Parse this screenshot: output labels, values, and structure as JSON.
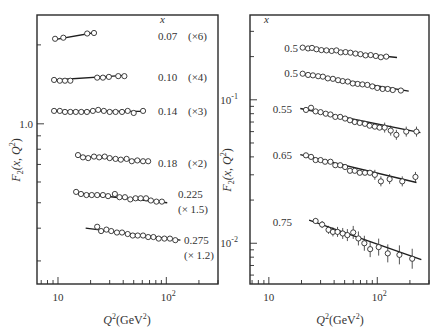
{
  "chart_data": [
    {
      "type": "scatter",
      "panel": "left",
      "title": "",
      "xlabel": "Q²(GeV²)",
      "ylabel": "F₂(x, Q²)",
      "xscale": "log",
      "yscale": "log",
      "xlim": [
        6.4,
        300
      ],
      "ylim": [
        0.245,
        2.6
      ],
      "x_ticks": [
        {
          "value": 10,
          "label": "10"
        },
        {
          "value": 100,
          "label": "10",
          "sup": "2"
        }
      ],
      "y_ticks": [
        {
          "value": 1.0,
          "label": "1.0"
        }
      ],
      "y_minor_ticks": [
        0.3,
        0.4,
        0.5,
        0.6,
        0.7,
        0.8,
        0.9,
        2.0
      ],
      "legend_header": "x",
      "series": [
        {
          "name": "0.07",
          "scale": "(×6)",
          "fit": [
            [
              9.0,
              2.09
            ],
            [
              22,
              2.23
            ]
          ],
          "points": [
            [
              9.4,
              2.11
            ],
            [
              11.2,
              2.13
            ],
            [
              18.6,
              2.21
            ],
            [
              21.5,
              2.22
            ]
          ]
        },
        {
          "name": "0.10",
          "scale": "(×4)",
          "fit": [
            [
              9.0,
              1.47
            ],
            [
              41,
              1.53
            ]
          ],
          "points": [
            [
              9.2,
              1.47
            ],
            [
              10.4,
              1.46
            ],
            [
              11.6,
              1.46
            ],
            [
              13.0,
              1.46
            ],
            [
              23,
              1.5
            ],
            [
              26,
              1.5
            ],
            [
              29.5,
              1.51
            ],
            [
              36,
              1.52
            ],
            [
              41,
              1.52
            ]
          ]
        },
        {
          "name": "0.14",
          "scale": "(×3)",
          "fit": [
            [
              9.0,
              1.12
            ],
            [
              61,
              1.115
            ]
          ],
          "points": [
            [
              9.2,
              1.12
            ],
            [
              10.4,
              1.12
            ],
            [
              11.6,
              1.11
            ],
            [
              13.0,
              1.11
            ],
            [
              14.6,
              1.11
            ],
            [
              16.4,
              1.11
            ],
            [
              18.5,
              1.11
            ],
            [
              21,
              1.12
            ],
            [
              23.5,
              1.13
            ],
            [
              26.5,
              1.12
            ],
            [
              30,
              1.11
            ],
            [
              34,
              1.11
            ],
            [
              39,
              1.11
            ],
            [
              44,
              1.12
            ],
            [
              50,
              1.1
            ],
            [
              61,
              1.12
            ]
          ]
        },
        {
          "name": "0.18",
          "scale": "(×2)",
          "fit": [
            [
              15.0,
              0.755
            ],
            [
              68,
              0.72
            ]
          ],
          "points": [
            [
              15.3,
              0.76
            ],
            [
              17.0,
              0.745
            ],
            [
              19.0,
              0.74
            ],
            [
              21.5,
              0.75
            ],
            [
              24,
              0.745
            ],
            [
              27,
              0.75
            ],
            [
              30,
              0.74
            ],
            [
              34,
              0.735
            ],
            [
              38,
              0.73
            ],
            [
              43,
              0.735
            ],
            [
              48,
              0.72
            ],
            [
              54,
              0.725
            ],
            [
              61,
              0.72
            ],
            [
              68,
              0.72
            ]
          ]
        },
        {
          "name": "0.225",
          "scale": "(× 1.5)",
          "fit": [
            [
              14.5,
              0.545
            ],
            [
              102,
              0.5
            ]
          ],
          "points": [
            [
              14.7,
              0.55
            ],
            [
              16.3,
              0.54
            ],
            [
              18.3,
              0.535
            ],
            [
              20.5,
              0.535
            ],
            [
              23,
              0.535
            ],
            [
              26,
              0.535
            ],
            [
              29,
              0.53
            ],
            [
              33.5,
              0.54
            ],
            [
              37,
              0.525
            ],
            [
              41.5,
              0.525
            ],
            [
              46.5,
              0.515
            ],
            [
              52,
              0.52
            ],
            [
              58,
              0.52
            ],
            [
              65,
              0.52
            ],
            [
              72,
              0.51
            ],
            [
              81,
              0.505
            ],
            [
              91,
              0.505
            ]
          ]
        },
        {
          "name": "0.275",
          "scale": "(× 1.2)",
          "fit": [
            [
              18,
              0.4
            ],
            [
              135,
              0.36
            ]
          ],
          "points": [
            [
              23,
              0.405
            ],
            [
              25,
              0.39
            ],
            [
              28,
              0.395
            ],
            [
              31,
              0.39
            ],
            [
              35,
              0.385
            ],
            [
              39,
              0.385
            ],
            [
              44,
              0.38
            ],
            [
              49,
              0.375
            ],
            [
              54.5,
              0.375
            ],
            [
              61,
              0.375
            ],
            [
              68,
              0.37
            ],
            [
              76,
              0.37
            ],
            [
              85,
              0.365
            ],
            [
              96,
              0.365
            ],
            [
              108,
              0.365
            ],
            [
              121,
              0.36
            ]
          ]
        }
      ]
    },
    {
      "type": "scatter",
      "panel": "right",
      "title": "",
      "xlabel": "Q²(GeV²)",
      "ylabel": "F₂(x, Q²)",
      "xscale": "log",
      "yscale": "log",
      "xlim": [
        6.7,
        300
      ],
      "ylim": [
        0.0052,
        0.39
      ],
      "x_ticks": [
        {
          "value": 10,
          "label": "10"
        },
        {
          "value": 100,
          "label": "10",
          "sup": "2"
        }
      ],
      "y_ticks": [
        {
          "value": 0.1,
          "label": "10",
          "sup": "-1"
        },
        {
          "value": 0.01,
          "label": "10",
          "sup": "-2"
        }
      ],
      "y_minor_ticks": [
        0.3,
        0.2,
        0.09,
        0.08,
        0.07,
        0.06,
        0.05,
        0.04,
        0.03,
        0.02,
        0.009,
        0.008,
        0.007,
        0.006
      ],
      "legend_header": "x",
      "series": [
        {
          "name": "0.5",
          "fit": [
            [
              19.5,
              0.232
            ],
            [
              152,
              0.197
            ]
          ],
          "points": [
            [
              20.5,
              0.231
            ],
            [
              23,
              0.228
            ],
            [
              25,
              0.23
            ],
            [
              27.5,
              0.225
            ],
            [
              30.5,
              0.222
            ],
            [
              34,
              0.221
            ],
            [
              38,
              0.219
            ],
            [
              42,
              0.221
            ],
            [
              46,
              0.214
            ],
            [
              51,
              0.215
            ],
            [
              56.5,
              0.213
            ],
            [
              63,
              0.21
            ],
            [
              70,
              0.208
            ],
            [
              78,
              0.204
            ],
            [
              87,
              0.205
            ],
            [
              97,
              0.202
            ],
            [
              108,
              0.198
            ],
            [
              121,
              0.2
            ]
          ]
        },
        {
          "name": "0.5",
          "fit": [
            [
              20,
              0.153
            ],
            [
              195,
              0.115
            ]
          ],
          "points": [
            [
              20.5,
              0.152
            ],
            [
              23,
              0.149
            ],
            [
              25.5,
              0.148
            ],
            [
              28.5,
              0.146
            ],
            [
              31.5,
              0.145
            ],
            [
              35,
              0.141
            ],
            [
              39,
              0.14
            ],
            [
              43.5,
              0.137
            ],
            [
              48,
              0.135
            ],
            [
              53.5,
              0.134
            ],
            [
              59.5,
              0.13
            ],
            [
              66,
              0.129
            ],
            [
              73,
              0.128
            ],
            [
              81,
              0.127
            ],
            [
              90,
              0.124
            ],
            [
              100,
              0.121
            ],
            [
              112,
              0.119
            ],
            [
              125,
              0.119
            ],
            [
              139,
              0.117
            ],
            [
              165,
              0.116
            ]
          ]
        },
        {
          "name": "0.55",
          "fit": [
            [
              19.5,
              0.087
            ],
            [
              250,
              0.059
            ]
          ],
          "points": [
            [
              22,
              0.085
            ],
            [
              24.5,
              0.088
            ],
            [
              27,
              0.083
            ],
            [
              30,
              0.082
            ],
            [
              33.5,
              0.08
            ],
            [
              37,
              0.079
            ],
            [
              41,
              0.076
            ],
            [
              45.5,
              0.076
            ],
            [
              50.5,
              0.074
            ],
            [
              56,
              0.072
            ],
            [
              62,
              0.07
            ],
            [
              69,
              0.069
            ],
            [
              77,
              0.068
            ],
            [
              85,
              0.066
            ],
            [
              95,
              0.065
            ],
            [
              105,
              0.064
            ],
            [
              117,
              0.064
            ],
            [
              133,
              0.061
            ],
            [
              150,
              0.057
            ],
            [
              185,
              0.06
            ],
            [
              230,
              0.06
            ]
          ]
        },
        {
          "name": "0.65",
          "fit": [
            [
              19.5,
              0.0415
            ],
            [
              230,
              0.0265
            ]
          ],
          "points": [
            [
              22,
              0.041
            ],
            [
              24.5,
              0.04
            ],
            [
              27,
              0.038
            ],
            [
              30,
              0.038
            ],
            [
              33,
              0.037
            ],
            [
              37,
              0.037
            ],
            [
              41,
              0.035
            ],
            [
              45.5,
              0.035
            ],
            [
              50.5,
              0.034
            ],
            [
              56,
              0.032
            ],
            [
              62,
              0.032
            ],
            [
              69,
              0.031
            ],
            [
              77,
              0.031
            ],
            [
              85.5,
              0.031
            ],
            [
              95,
              0.03
            ],
            [
              108,
              0.027
            ],
            [
              130,
              0.028
            ],
            [
              170,
              0.027
            ],
            [
              225,
              0.029
            ]
          ]
        },
        {
          "name": "0.75",
          "fit": [
            [
              23.5,
              0.0145
            ],
            [
              255,
              0.0077
            ]
          ],
          "points": [
            [
              27,
              0.0143
            ],
            [
              31,
              0.0135
            ],
            [
              35.5,
              0.0124
            ],
            [
              39,
              0.012
            ],
            [
              43,
              0.012
            ],
            [
              48,
              0.0117
            ],
            [
              53,
              0.0114
            ],
            [
              60,
              0.0119
            ],
            [
              67,
              0.0108
            ],
            [
              76,
              0.01
            ],
            [
              86,
              0.0091
            ],
            [
              103,
              0.0094
            ],
            [
              125,
              0.0085
            ],
            [
              160,
              0.0083
            ],
            [
              210,
              0.0078
            ]
          ]
        }
      ]
    }
  ],
  "labels": {
    "left_header": "x",
    "right_header": "x",
    "xlabel_q": "Q",
    "xlabel_rest": "(GeV",
    "xlabel_close": ")",
    "ylabel_f": "F",
    "ylabel_sub": "2",
    "ylabel_rest": "(x, Q",
    "ylabel_close": ")",
    "sup2": "2"
  }
}
